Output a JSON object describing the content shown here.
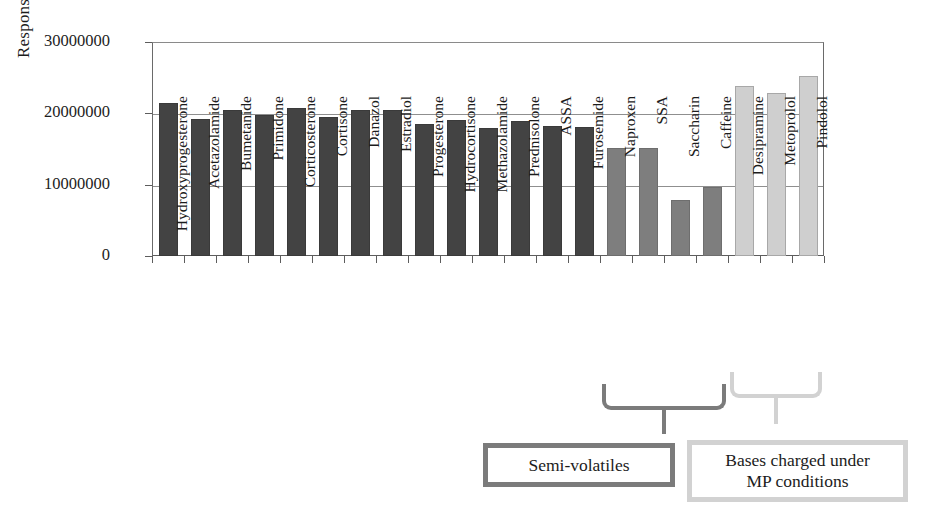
{
  "chart_data": {
    "type": "bar",
    "title": "",
    "xlabel": "",
    "ylabel": "Response Factor",
    "ylim": [
      0,
      30000000
    ],
    "yticks": [
      0,
      10000000,
      20000000,
      30000000
    ],
    "ytick_labels": [
      "0",
      "10000000",
      "20000000",
      "30000000"
    ],
    "grid": true,
    "legend": "none",
    "categories": [
      "Hydroxyprogesterone",
      "Acetazolamide",
      "Bumetanide",
      "Primidone",
      "Corticosterone",
      "Cortisone",
      "Danazol",
      "Estradiol",
      "Progesterone",
      "Hydrocortisone",
      "Methazolamide",
      "Prednisolone",
      "ASSA",
      "Furosemide",
      "Naproxen",
      "SSA",
      "Saccharin",
      "Caffeine",
      "Desipramine",
      "Metoprolol",
      "Pindolol"
    ],
    "values": [
      21500000,
      19200000,
      20400000,
      19800000,
      20700000,
      19500000,
      20500000,
      20400000,
      18500000,
      19100000,
      18000000,
      18900000,
      18200000,
      18100000,
      15200000,
      15200000,
      7800000,
      9700000,
      23900000,
      22800000,
      25300000
    ],
    "groups": [
      "neutral",
      "neutral",
      "neutral",
      "neutral",
      "neutral",
      "neutral",
      "neutral",
      "neutral",
      "neutral",
      "neutral",
      "neutral",
      "neutral",
      "neutral",
      "neutral",
      "semi-volatile",
      "semi-volatile",
      "semi-volatile",
      "semi-volatile",
      "base",
      "base",
      "base"
    ],
    "group_colors": {
      "neutral": "#434343",
      "semi-volatile": "#7e7e7e",
      "base": "#cfcfcf"
    },
    "annotations": [
      {
        "name": "semi-volatiles",
        "label": "Semi-volatiles",
        "color": "#7b7b7b",
        "covers": [
          "Naproxen",
          "SSA",
          "Saccharin",
          "Caffeine"
        ]
      },
      {
        "name": "bases-charged",
        "label": "Bases charged under\nMP conditions",
        "label_line1": "Bases charged under",
        "label_line2": "MP conditions",
        "color": "#d2d2d2",
        "covers": [
          "Desipramine",
          "Metoprolol",
          "Pindolol"
        ]
      }
    ]
  },
  "axes": {
    "y_title": "Response Factor"
  },
  "callouts": {
    "semi_volatiles": "Semi-volatiles",
    "bases_line1": "Bases charged under",
    "bases_line2": "MP conditions"
  }
}
